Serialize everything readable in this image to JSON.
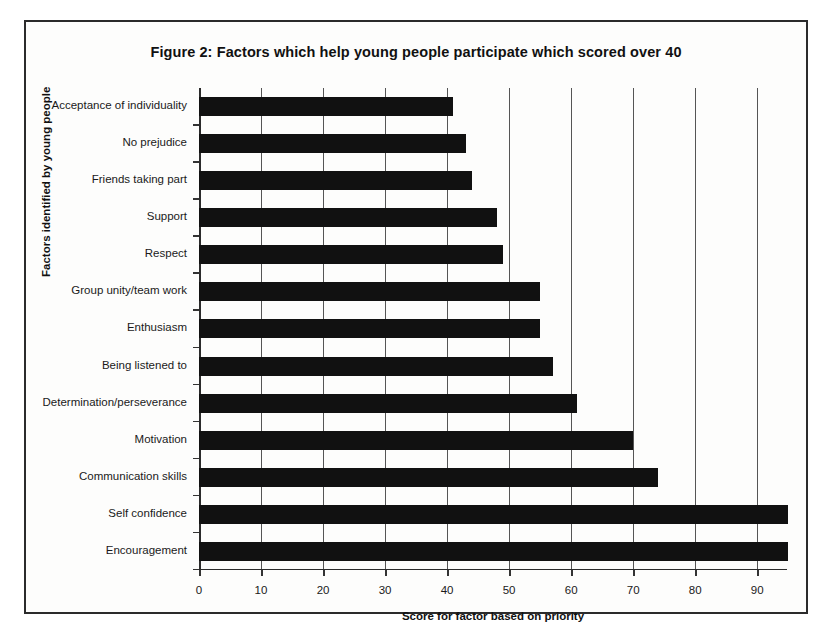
{
  "figure": {
    "title": "Figure 2: Factors which help young people participate which scored over 40"
  },
  "chart_data": {
    "type": "bar",
    "orientation": "horizontal",
    "title": "Figure 2: Factors which help young people participate which scored over 40",
    "xlabel": "Score for factor based on priority",
    "ylabel": "Factors identified by young people",
    "xlim": [
      0,
      94.8
    ],
    "xticks": [
      0,
      10,
      20,
      30,
      40,
      50,
      60,
      70,
      80,
      90
    ],
    "xtick_labels": [
      "0",
      "10",
      "20",
      "30",
      "40",
      "50",
      "60",
      "70",
      "80",
      "90"
    ],
    "grid": "vertical",
    "legend": "none",
    "bar_color": "#111111",
    "categories": [
      "Acceptance of individuality",
      "No prejudice",
      "Friends taking part",
      "Support",
      "Respect",
      "Group unity/team work",
      "Enthusiasm",
      "Being listened to",
      "Determination/perseverance",
      "Motivation",
      "Communication skills",
      "Self confidence",
      "Encouragement"
    ],
    "values": [
      41,
      43,
      44,
      48,
      49,
      55,
      55,
      57,
      61,
      70,
      74,
      95,
      95
    ]
  }
}
